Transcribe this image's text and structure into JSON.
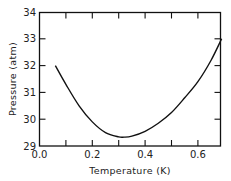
{
  "chart_data": {
    "type": "line",
    "title": "",
    "xlabel": "Temperature (K)",
    "ylabel": "Pressure (atm)",
    "xlim": [
      0.0,
      0.69
    ],
    "ylim": [
      29,
      34
    ],
    "xticks": [
      "0.0",
      "0.2",
      "0.4",
      "0.6"
    ],
    "yticks": [
      "29",
      "30",
      "31",
      "32",
      "33",
      "34"
    ],
    "grid": false,
    "legend": null,
    "series": [
      {
        "name": "melting curve",
        "x": [
          0.06,
          0.1,
          0.15,
          0.2,
          0.25,
          0.3,
          0.32,
          0.35,
          0.4,
          0.45,
          0.5,
          0.55,
          0.6,
          0.65,
          0.69
        ],
        "y": [
          32.0,
          31.3,
          30.5,
          29.9,
          29.5,
          29.34,
          29.33,
          29.37,
          29.55,
          29.85,
          30.25,
          30.8,
          31.4,
          32.2,
          33.0
        ]
      }
    ]
  }
}
